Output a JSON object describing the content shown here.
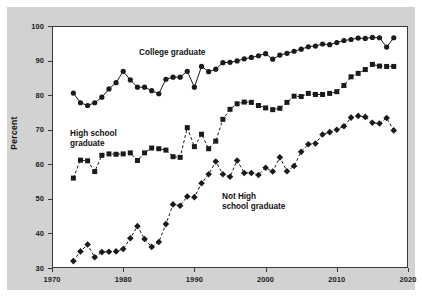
{
  "axes": {
    "ylabel": "Percent",
    "yticks": [
      30,
      40,
      50,
      60,
      70,
      80,
      90,
      100
    ],
    "xticks": [
      1970,
      1980,
      1990,
      2000,
      2010,
      2020
    ],
    "ylim": [
      30,
      100
    ],
    "xlim": [
      1970,
      2020
    ]
  },
  "annotations": {
    "college": "College graduate",
    "high_school": "High school\ngraduate",
    "not_high_school": "Not High\nschool graduate"
  },
  "chart_data": {
    "type": "line",
    "title": "",
    "subtitle": "",
    "xlabel": "",
    "ylabel": "Percent",
    "xlim": [
      1970,
      2020
    ],
    "ylim": [
      30,
      100
    ],
    "grid": false,
    "legend_position": "inline-annotations",
    "xticks": [
      1970,
      1980,
      1990,
      2000,
      2010,
      2020
    ],
    "yticks": [
      30,
      40,
      50,
      60,
      70,
      80,
      90,
      100
    ],
    "series": [
      {
        "name": "College graduate",
        "marker": "circle",
        "linestyle": "solid",
        "color": "#1a1a1a",
        "x": [
          1973,
          1974,
          1975,
          1976,
          1977,
          1978,
          1979,
          1980,
          1981,
          1982,
          1983,
          1984,
          1985,
          1986,
          1987,
          1988,
          1989,
          1990,
          1991,
          1992,
          1993,
          1994,
          1995,
          1996,
          1997,
          1998,
          1999,
          2000,
          2001,
          2002,
          2003,
          2004,
          2005,
          2006,
          2007,
          2008,
          2009,
          2010,
          2011,
          2012,
          2013,
          2014,
          2015,
          2016,
          2017,
          2018
        ],
        "y": [
          80.6,
          77.8,
          77.0,
          77.8,
          79.4,
          81.8,
          83.6,
          86.9,
          84.4,
          82.3,
          82.3,
          81.3,
          80.4,
          84.6,
          85.2,
          85.2,
          86.9,
          82.3,
          88.3,
          86.8,
          87.5,
          89.4,
          89.5,
          89.9,
          90.5,
          90.9,
          91.4,
          92.0,
          90.4,
          91.6,
          92.1,
          92.7,
          93.3,
          94.0,
          94.2,
          94.8,
          94.6,
          95.2,
          95.8,
          96.1,
          96.5,
          96.4,
          96.7,
          96.6,
          93.9,
          96.6
        ]
      },
      {
        "name": "High school graduate",
        "marker": "square",
        "linestyle": "dashed",
        "color": "#1a1a1a",
        "x": [
          1973,
          1974,
          1975,
          1976,
          1977,
          1978,
          1979,
          1980,
          1981,
          1982,
          1983,
          1984,
          1985,
          1986,
          1987,
          1988,
          1989,
          1990,
          1991,
          1992,
          1993,
          1994,
          1995,
          1996,
          1997,
          1998,
          1999,
          2000,
          2001,
          2002,
          2003,
          2004,
          2005,
          2006,
          2007,
          2008,
          2009,
          2010,
          2011,
          2012,
          2013,
          2014,
          2015,
          2016,
          2017,
          2018
        ],
        "y": [
          56.0,
          61.2,
          61.0,
          57.9,
          62.6,
          63.0,
          62.9,
          63.0,
          63.3,
          61.1,
          63.3,
          64.7,
          64.5,
          64.1,
          62.2,
          62.0,
          70.6,
          65.1,
          68.7,
          64.5,
          66.7,
          73.0,
          75.9,
          77.5,
          78.0,
          77.9,
          77.0,
          76.3,
          75.8,
          76.2,
          77.9,
          79.7,
          79.6,
          80.5,
          80.2,
          80.2,
          80.5,
          81.0,
          82.8,
          85.3,
          86.3,
          87.4,
          88.9,
          88.4,
          88.3,
          88.3
        ]
      },
      {
        "name": "Not High school graduate",
        "marker": "diamond",
        "linestyle": "dashed",
        "color": "#1a1a1a",
        "x": [
          1973,
          1974,
          1975,
          1976,
          1977,
          1978,
          1979,
          1980,
          1981,
          1982,
          1983,
          1984,
          1985,
          1986,
          1987,
          1988,
          1989,
          1990,
          1991,
          1992,
          1993,
          1994,
          1995,
          1996,
          1997,
          1998,
          1999,
          2000,
          2001,
          2002,
          2003,
          2004,
          2005,
          2006,
          2007,
          2008,
          2009,
          2010,
          2011,
          2012,
          2013,
          2014,
          2015,
          2016,
          2017,
          2018
        ],
        "y": [
          32.0,
          34.8,
          36.8,
          33.1,
          34.6,
          34.7,
          34.8,
          35.5,
          38.6,
          42.1,
          38.4,
          36.1,
          37.5,
          42.7,
          48.4,
          48.0,
          50.7,
          50.5,
          54.5,
          57.1,
          60.8,
          57.1,
          56.4,
          61.1,
          57.5,
          57.5,
          56.9,
          59.0,
          57.9,
          62.0,
          58.0,
          59.5,
          63.6,
          65.8,
          66.0,
          68.6,
          69.3,
          70.0,
          71.0,
          73.5,
          74.0,
          73.7,
          72.0,
          71.8,
          73.4,
          69.8
        ]
      }
    ]
  }
}
